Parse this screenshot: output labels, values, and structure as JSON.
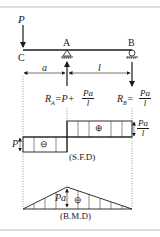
{
  "figure": {
    "loads": {
      "point_load": "P"
    },
    "points": {
      "free_end": "C",
      "support_a": "A",
      "support_b": "B"
    },
    "dimensions": {
      "overhang": "a",
      "span": "l"
    },
    "reactions": {
      "ra_lhs": "R",
      "ra_sub": "A",
      "ra_rhs": "=P+",
      "ra_num": "Pa",
      "ra_den": "l",
      "rb_lhs": "R",
      "rb_sub": "B",
      "rb_rhs": "=",
      "rb_num": "Pa",
      "rb_den": "l"
    },
    "sfd": {
      "title": "(S.F.D)",
      "left_value": "P",
      "left_sign": "⊖",
      "right_sign": "⊕",
      "right_num": "Pa",
      "right_den": "l"
    },
    "bmd": {
      "title": "(B.M.D)",
      "peak_value": "Pa",
      "sign": "⊖"
    },
    "colors": {
      "ink": "#1a1a1a",
      "frame": "#bdbdbd",
      "guide": "#555555"
    }
  }
}
